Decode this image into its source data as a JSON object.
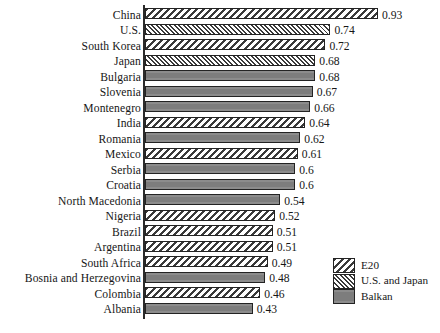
{
  "chart_data": {
    "type": "bar",
    "orientation": "horizontal",
    "title": "",
    "subtitle": "",
    "xlabel": "",
    "ylabel": "",
    "xlim": [
      0,
      0.93
    ],
    "grid": false,
    "legend_position": "bottom-right",
    "categories": [
      "China",
      "U.S.",
      "South Korea",
      "Japan",
      "Bulgaria",
      "Slovenia",
      "Montenegro",
      "India",
      "Romania",
      "Mexico",
      "Serbia",
      "Croatia",
      "North Macedonia",
      "Nigeria",
      "Brazil",
      "Argentina",
      "South Africa",
      "Bosnia and Herzegovina",
      "Colombia",
      "Albania"
    ],
    "values": [
      0.93,
      0.74,
      0.72,
      0.68,
      0.68,
      0.67,
      0.66,
      0.64,
      0.62,
      0.61,
      0.6,
      0.6,
      0.54,
      0.52,
      0.51,
      0.51,
      0.49,
      0.48,
      0.46,
      0.43
    ],
    "value_labels": [
      "0.93",
      "0.74",
      "0.72",
      "0.68",
      "0.68",
      "0.67",
      "0.66",
      "0.64",
      "0.62",
      "0.61",
      "0.6",
      "0.6",
      "0.54",
      "0.52",
      "0.51",
      "0.51",
      "0.49",
      "0.48",
      "0.46",
      "0.43"
    ],
    "groups": [
      "E20",
      "U.S. and Japan",
      "E20",
      "U.S. and Japan",
      "Balkan",
      "Balkan",
      "Balkan",
      "E20",
      "Balkan",
      "E20",
      "Balkan",
      "Balkan",
      "Balkan",
      "E20",
      "E20",
      "E20",
      "E20",
      "Balkan",
      "E20",
      "Balkan"
    ],
    "legend": [
      {
        "label": "E20",
        "pattern": "backslash-hatch",
        "color": "#ffffff"
      },
      {
        "label": "U.S. and Japan",
        "pattern": "forwardslash-hatch-fine",
        "color": "#ffffff"
      },
      {
        "label": "Balkan",
        "pattern": "solid",
        "color": "#848484"
      }
    ],
    "colors": {
      "hatch_line": "#3a3a3a",
      "bar_outline": "#232323",
      "balkan_fill": "#848484",
      "axis": "#2b2b2b",
      "text": "#161616",
      "background": "#ffffff"
    }
  }
}
